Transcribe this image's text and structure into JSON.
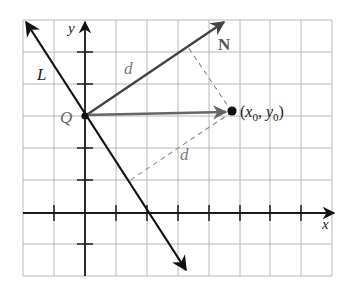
{
  "figure": {
    "labels": {
      "y_axis": "y",
      "x_axis": "x",
      "line": "L",
      "point_q": "Q",
      "normal": "N",
      "distance_upper": "d",
      "distance_lower": "d",
      "point_x": "x",
      "point_x_sub": "0",
      "point_y": "y",
      "point_y_sub": "0",
      "point_open": "(",
      "point_comma": ", ",
      "point_close": ")"
    },
    "colors": {
      "grid": "#b8b8b8",
      "axis": "#1a1a1a",
      "line_L": "#111111",
      "normal_vector": "#444444",
      "qp_vector": "#666666",
      "dashed": "#8a8a8a",
      "label_gray": "#777777",
      "label_dark": "#222222"
    }
  }
}
